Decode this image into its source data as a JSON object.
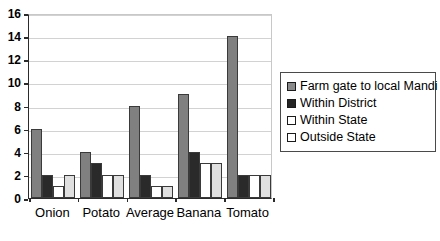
{
  "chart_data": {
    "type": "bar",
    "title": "",
    "subtitle": "",
    "xlabel": "",
    "ylabel": "",
    "categories": [
      "Onion",
      "Potato",
      "Average",
      "Banana",
      "Tomato"
    ],
    "series": [
      {
        "name": "Farm gate to local Mandi",
        "color": "#808080",
        "values": [
          6,
          4,
          8,
          9,
          14
        ]
      },
      {
        "name": "Within District",
        "color": "#2a2a2a",
        "values": [
          2,
          3,
          2,
          4,
          2
        ]
      },
      {
        "name": "Within State",
        "color": "#ffffff",
        "values": [
          1,
          2,
          1,
          3,
          2
        ]
      },
      {
        "name": "Outside State",
        "color": "#e0e0e0",
        "values": [
          2,
          2,
          1,
          3,
          2
        ]
      }
    ],
    "ylim": [
      0,
      16
    ],
    "ytick_step": 2,
    "yticks": [
      "0",
      "2",
      "4",
      "6",
      "8",
      "10",
      "12",
      "14",
      "16"
    ],
    "grid": true,
    "grid_axis": "y",
    "legend_position": "right",
    "legend_entries": [
      "Farm gate to local Mandi",
      "Within District",
      "Within State",
      "Outside State"
    ],
    "bar_grouping": "grouped"
  },
  "legend": {
    "items": [
      {
        "label": "Farm gate to local Mandi"
      },
      {
        "label": "Within District"
      },
      {
        "label": "Within State"
      },
      {
        "label": "Outside State"
      }
    ]
  },
  "colors": {
    "series_1": "#808080",
    "series_2": "#2a2a2a",
    "series_3": "#ffffff",
    "series_4": "#e0e0e0",
    "axis": "#2b2b2b",
    "grid": "#d2d2d2",
    "background": "#ffffff"
  }
}
